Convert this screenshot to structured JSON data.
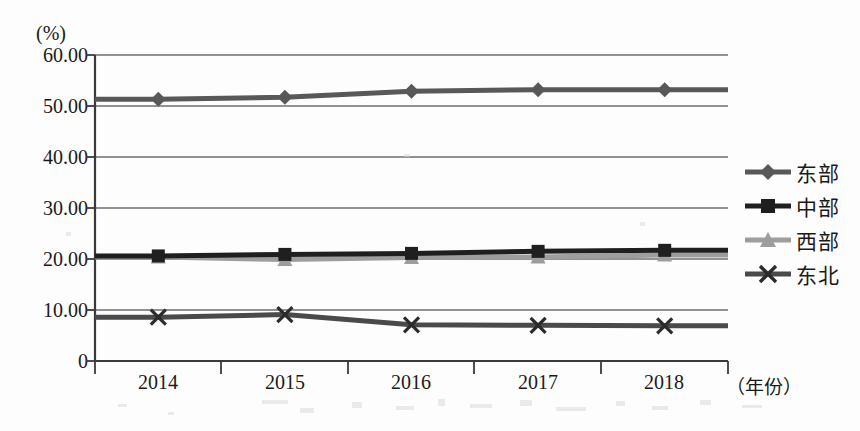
{
  "chart_data": {
    "type": "line",
    "title": "",
    "subtitle": "",
    "xlabel": "（年份）",
    "ylabel": "(%)",
    "categories": [
      "2014",
      "2015",
      "2016",
      "2017",
      "2018"
    ],
    "x": [
      2014,
      2015,
      2016,
      2017,
      2018
    ],
    "ylim": [
      0,
      60
    ],
    "ytick_labels": [
      "60.00",
      "50.00",
      "40.00",
      "30.00",
      "20.00",
      "10.00",
      "0"
    ],
    "ytick_values": [
      60,
      50,
      40,
      30,
      20,
      10,
      0
    ],
    "grid": true,
    "legend_position": "right",
    "series": [
      {
        "name": "东部",
        "marker": "diamond",
        "color": "#585858",
        "values": [
          51.3,
          51.7,
          52.9,
          53.2,
          53.2
        ]
      },
      {
        "name": "中部",
        "marker": "square",
        "color": "#1f1f1f",
        "values": [
          20.6,
          20.9,
          21.1,
          21.5,
          21.7
        ]
      },
      {
        "name": "西部",
        "marker": "triangle",
        "color": "#9d9d9d",
        "values": [
          20.4,
          19.9,
          20.3,
          20.4,
          20.8
        ]
      },
      {
        "name": "东北",
        "marker": "cross-x",
        "color": "#4a4a4a",
        "values": [
          8.6,
          9.1,
          7.1,
          7.0,
          6.9
        ]
      }
    ]
  },
  "axis": {
    "unit_label": "(%)",
    "x_title": "（年份）"
  },
  "legend": {
    "items": [
      {
        "label": "东部"
      },
      {
        "label": "中部"
      },
      {
        "label": "西部"
      },
      {
        "label": "东北"
      }
    ]
  },
  "colors": {
    "axis": "#3a3a3a",
    "grid": "#6e6e6e",
    "background": "#fdfdfd",
    "series_east": "#585858",
    "series_central": "#1f1f1f",
    "series_west": "#9d9d9d",
    "series_northeast": "#4a4a4a"
  }
}
